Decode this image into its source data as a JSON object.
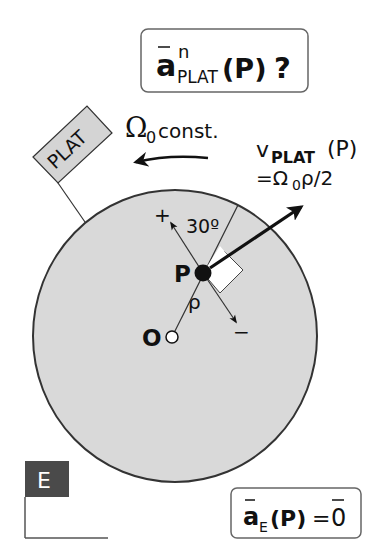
{
  "question_box": {
    "symbol": "a",
    "superscript": "n",
    "subscript": "PLAT",
    "argument": "(P)",
    "question_mark": "?"
  },
  "platform_flag": {
    "label": "PLAT"
  },
  "angular_velocity": {
    "symbol": "Ω",
    "subscript": "0",
    "note": "const."
  },
  "velocity_label": {
    "symbol": "v",
    "subscript": "PLAT",
    "argument": "(P)",
    "equation_prefix": "=Ω",
    "equation_sub": "0",
    "equation_suffix": "ρ/2"
  },
  "disk": {
    "fill_color": "#d9d9d9",
    "outline_color": "#333333",
    "point_p_label": "P",
    "point_o_label": "O",
    "radius_label": "ρ",
    "angle_label": "30º",
    "plus_label": "+",
    "minus_label": "−"
  },
  "frame": {
    "label": "E",
    "badge_color": "#4a4a4a"
  },
  "result_box": {
    "symbol": "a",
    "subscript": "E",
    "argument": "(P)",
    "equals": "=",
    "zero": "0"
  }
}
